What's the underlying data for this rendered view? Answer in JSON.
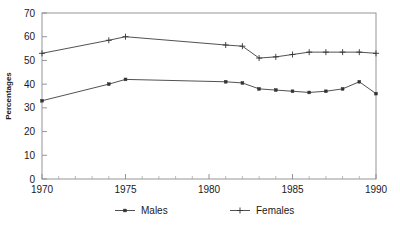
{
  "chart_data": {
    "type": "line",
    "title": "",
    "xlabel": "",
    "ylabel": "Percentages",
    "xlim": [
      1970,
      1990
    ],
    "ylim": [
      0,
      70
    ],
    "ytick_labels": [
      "0",
      "10",
      "20",
      "30",
      "40",
      "50",
      "60",
      "70"
    ],
    "yticks": [
      0,
      10,
      20,
      30,
      40,
      50,
      60,
      70
    ],
    "xtick_labels": [
      "1970",
      "1975",
      "1980",
      "1985",
      "1990"
    ],
    "xticks": [
      1970,
      1975,
      1980,
      1985,
      1990
    ],
    "minor_xticks": [
      1971,
      1972,
      1973,
      1974,
      1976,
      1977,
      1978,
      1979,
      1981,
      1982,
      1983,
      1984,
      1986,
      1987,
      1988,
      1989
    ],
    "grid": false,
    "legend_position": "bottom",
    "x": [
      1970,
      1974,
      1975,
      1981,
      1982,
      1983,
      1984,
      1985,
      1986,
      1987,
      1988,
      1989,
      1990
    ],
    "series": [
      {
        "name": "Males",
        "marker": "square",
        "color": "#333333",
        "values": [
          33,
          40,
          42,
          41,
          40.5,
          38,
          37.5,
          37,
          36.5,
          37,
          38,
          41,
          36
        ]
      },
      {
        "name": "Females",
        "marker": "plus",
        "color": "#333333",
        "values": [
          53,
          58.5,
          60,
          56.5,
          56,
          51,
          51.5,
          52.5,
          53.5,
          53.5,
          53.5,
          53.5,
          53
        ]
      }
    ]
  },
  "legend": {
    "items": [
      {
        "label": "Males",
        "marker": "square"
      },
      {
        "label": "Females",
        "marker": "plus"
      }
    ]
  },
  "axes": {
    "y_title": "Percentages"
  }
}
